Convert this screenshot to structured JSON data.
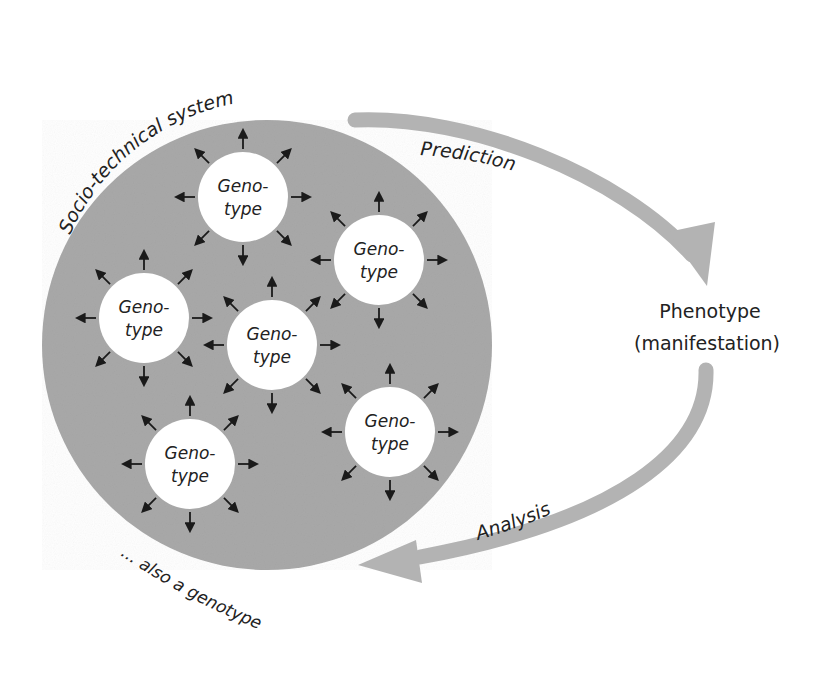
{
  "diagram": {
    "system_label": "Socio-technical system",
    "prediction_label": "Prediction",
    "analysis_label": "Analysis",
    "phenotype": {
      "line1": "Phenotype",
      "line2": "(manifestation)"
    },
    "genotype_footer": "... also a genotype",
    "genotypes": [
      {
        "line1": "Geno-",
        "line2": "type"
      },
      {
        "line1": "Geno-",
        "line2": "type"
      },
      {
        "line1": "Geno-",
        "line2": "type"
      },
      {
        "line1": "Geno-",
        "line2": "type"
      },
      {
        "line1": "Geno-",
        "line2": "type"
      },
      {
        "line1": "Geno-",
        "line2": "type"
      }
    ],
    "colors": {
      "system_fill": "#a9a9a9",
      "genotype_fill": "#ffffff",
      "arrow_fill": "#b3b3b3",
      "text": "#222222"
    }
  }
}
